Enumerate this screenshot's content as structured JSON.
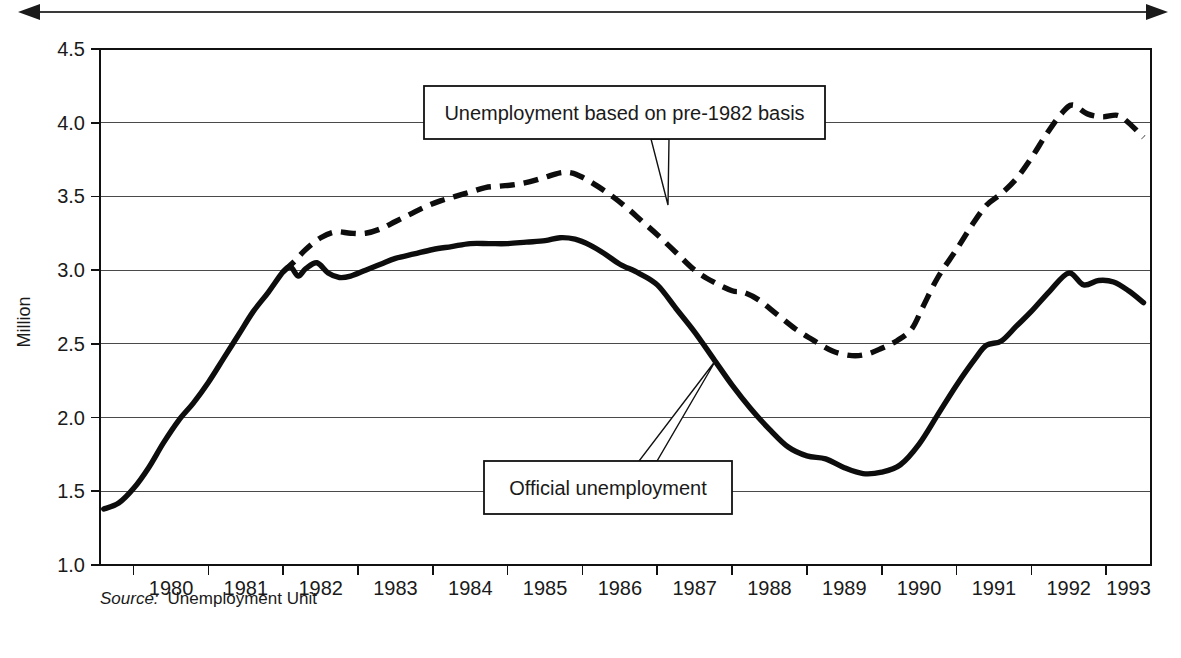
{
  "figure": {
    "width": 1181,
    "height": 658,
    "background": "#ffffff",
    "ink_color": "#0d0d0d"
  },
  "span_arrow": {
    "name": "double-headed-span-arrow",
    "x_start": 18,
    "x_end": 1168,
    "y": 12
  },
  "source_note": {
    "prefix": "Source:",
    "text": "Unemployment Unit"
  },
  "callouts": [
    {
      "id": "pre-1982-basis",
      "label": "Unemployment based on pre-1982 basis",
      "box": {
        "x": 424,
        "y": 86,
        "width": 401,
        "height": 53
      },
      "pointer_from": {
        "x": 660,
        "y": 139
      },
      "pointer_to": {
        "x": 668,
        "y": 205
      }
    },
    {
      "id": "official-unemployment",
      "label": "Official unemployment",
      "box": {
        "x": 484,
        "y": 461,
        "width": 248,
        "height": 53
      },
      "pointer_from": {
        "x": 648,
        "y": 461
      },
      "pointer_to": {
        "x": 716,
        "y": 360
      }
    }
  ],
  "chart_data": {
    "type": "line",
    "title": "",
    "subtitle": "",
    "xlabel": "",
    "ylabel": "Million",
    "xlim": [
      1979.55,
      1993.6
    ],
    "ylim": [
      1.0,
      4.5
    ],
    "yticks": [
      1.0,
      1.5,
      2.0,
      2.5,
      3.0,
      3.5,
      4.0,
      4.5
    ],
    "ytick_labels": [
      "1.0",
      "1.5",
      "2.0",
      "2.5",
      "3.0",
      "3.5",
      "4.0",
      "4.5"
    ],
    "xticks": [
      1980,
      1981,
      1982,
      1983,
      1984,
      1985,
      1986,
      1987,
      1988,
      1989,
      1990,
      1991,
      1992,
      1993
    ],
    "xtick_labels": [
      "1980",
      "1981",
      "1982",
      "1983",
      "1984",
      "1985",
      "1986",
      "1987",
      "1988",
      "1989",
      "1990",
      "1991",
      "1992",
      "1993"
    ],
    "grid": true,
    "grid_axis": "y",
    "legend": "annotated-callouts",
    "legend_position": "inline",
    "plot_box_px": {
      "left": 100,
      "top": 49,
      "right": 1151,
      "bottom": 565
    },
    "series": [
      {
        "name": "Official unemployment",
        "style": "solid",
        "x": [
          1979.6,
          1979.8,
          1980.0,
          1980.2,
          1980.4,
          1980.6,
          1980.8,
          1981.0,
          1981.2,
          1981.4,
          1981.6,
          1981.8,
          1982.0,
          1982.1,
          1982.2,
          1982.3,
          1982.45,
          1982.6,
          1982.75,
          1982.9,
          1983.1,
          1983.3,
          1983.5,
          1983.75,
          1984.0,
          1984.25,
          1984.5,
          1984.75,
          1985.0,
          1985.25,
          1985.5,
          1985.7,
          1985.9,
          1986.1,
          1986.3,
          1986.5,
          1986.75,
          1987.0,
          1987.25,
          1987.5,
          1987.75,
          1988.0,
          1988.25,
          1988.5,
          1988.75,
          1989.0,
          1989.25,
          1989.5,
          1989.75,
          1990.0,
          1990.25,
          1990.5,
          1990.75,
          1991.0,
          1991.25,
          1991.4,
          1991.6,
          1991.8,
          1992.0,
          1992.25,
          1992.5,
          1992.7,
          1992.9,
          1993.1,
          1993.3,
          1993.5
        ],
        "y": [
          1.38,
          1.42,
          1.52,
          1.66,
          1.83,
          1.98,
          2.1,
          2.24,
          2.4,
          2.56,
          2.72,
          2.85,
          2.99,
          3.02,
          2.96,
          3.01,
          3.05,
          2.98,
          2.95,
          2.96,
          3.0,
          3.04,
          3.08,
          3.11,
          3.14,
          3.16,
          3.18,
          3.18,
          3.18,
          3.19,
          3.2,
          3.22,
          3.21,
          3.17,
          3.11,
          3.04,
          2.98,
          2.9,
          2.74,
          2.58,
          2.4,
          2.22,
          2.06,
          1.92,
          1.8,
          1.74,
          1.72,
          1.66,
          1.62,
          1.63,
          1.68,
          1.82,
          2.02,
          2.22,
          2.4,
          2.49,
          2.52,
          2.62,
          2.72,
          2.86,
          2.98,
          2.9,
          2.93,
          2.92,
          2.86,
          2.78
        ]
      },
      {
        "name": "Unemployment based on pre-1982 basis",
        "style": "dashed",
        "x": [
          1982.0,
          1982.15,
          1982.3,
          1982.5,
          1982.7,
          1982.9,
          1983.1,
          1983.3,
          1983.5,
          1983.7,
          1983.9,
          1984.1,
          1984.3,
          1984.5,
          1984.7,
          1984.9,
          1985.1,
          1985.3,
          1985.5,
          1985.7,
          1985.85,
          1986.0,
          1986.2,
          1986.4,
          1986.6,
          1986.8,
          1987.0,
          1987.25,
          1987.5,
          1987.75,
          1988.0,
          1988.15,
          1988.35,
          1988.6,
          1988.85,
          1989.1,
          1989.35,
          1989.6,
          1989.8,
          1990.0,
          1990.2,
          1990.4,
          1990.55,
          1990.75,
          1991.0,
          1991.2,
          1991.4,
          1991.6,
          1991.8,
          1992.0,
          1992.2,
          1992.4,
          1992.55,
          1992.75,
          1992.95,
          1993.15,
          1993.3,
          1993.5
        ],
        "y": [
          2.99,
          3.06,
          3.14,
          3.22,
          3.26,
          3.25,
          3.25,
          3.28,
          3.33,
          3.38,
          3.43,
          3.47,
          3.5,
          3.53,
          3.56,
          3.57,
          3.58,
          3.6,
          3.63,
          3.66,
          3.66,
          3.63,
          3.57,
          3.5,
          3.42,
          3.33,
          3.24,
          3.12,
          3.0,
          2.92,
          2.86,
          2.85,
          2.8,
          2.7,
          2.6,
          2.52,
          2.45,
          2.42,
          2.43,
          2.47,
          2.52,
          2.6,
          2.75,
          2.95,
          3.14,
          3.3,
          3.44,
          3.52,
          3.62,
          3.76,
          3.92,
          4.06,
          4.12,
          4.06,
          4.04,
          4.05,
          4.0,
          3.9
        ]
      }
    ]
  }
}
